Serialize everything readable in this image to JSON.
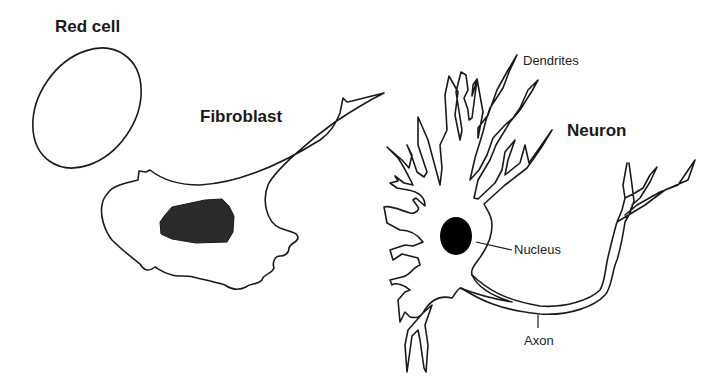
{
  "diagram": {
    "cells": [
      {
        "id": "red-cell",
        "title": "Red cell"
      },
      {
        "id": "fibroblast",
        "title": "Fibroblast"
      },
      {
        "id": "neuron",
        "title": "Neuron"
      }
    ],
    "neuron_labels": {
      "dendrites": "Dendrites",
      "nucleus": "Nucleus",
      "axon": "Axon"
    },
    "colors": {
      "outline": "#1a1a1a",
      "nucleus_fill_fibroblast": "#2a2a2a",
      "nucleus_fill_neuron": "#000000",
      "background": "#ffffff"
    }
  }
}
